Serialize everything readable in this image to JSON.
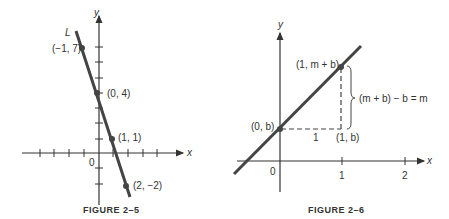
{
  "figures": [
    {
      "caption": "FIGURE 2–5",
      "line_label": "L",
      "axis_x_label": "x",
      "axis_y_label": "y",
      "origin_label": "0",
      "points": [
        {
          "label": "(−1, 7)",
          "x": -1,
          "y": 7
        },
        {
          "label": "(0, 4)",
          "x": 0,
          "y": 4
        },
        {
          "label": "(1, 1)",
          "x": 1,
          "y": 1
        },
        {
          "label": "(2, −2)",
          "x": 2,
          "y": -2
        }
      ]
    },
    {
      "caption": "FIGURE 2–6",
      "axis_x_label": "x",
      "axis_y_label": "y",
      "origin_label": "0",
      "x_ticks": [
        "1",
        "2"
      ],
      "points": [
        {
          "label": "(0, b)"
        },
        {
          "label": "(1, m + b)"
        },
        {
          "label": "(1, b)"
        }
      ],
      "run_label": "1",
      "rise_label": "(m + b) − b = m"
    }
  ]
}
